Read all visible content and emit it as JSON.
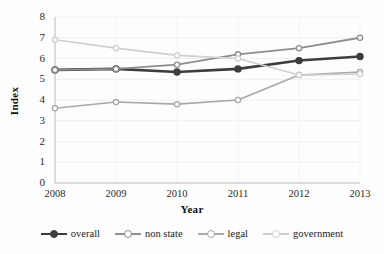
{
  "chart_data": {
    "type": "line",
    "title": "",
    "xlabel": "Year",
    "ylabel": "Index",
    "categories": [
      "2008",
      "2009",
      "2010",
      "2011",
      "2012",
      "2013"
    ],
    "x": [
      2008,
      2009,
      2010,
      2011,
      2012,
      2013
    ],
    "ylim": [
      0,
      8
    ],
    "yticks": [
      "0",
      "1",
      "2",
      "3",
      "4",
      "5",
      "6",
      "7",
      "8"
    ],
    "ytick_values": [
      0,
      1,
      2,
      3,
      4,
      5,
      6,
      7,
      8
    ],
    "grid": true,
    "legend_position": "bottom",
    "markers": "circle",
    "series": [
      {
        "name": "overall",
        "color": "#3d3d3d",
        "width": 2.6,
        "values": [
          5.45,
          5.5,
          5.35,
          5.5,
          5.9,
          6.1
        ]
      },
      {
        "name": "non state",
        "color": "#8e8e8e",
        "width": 1.8,
        "values": [
          5.45,
          5.5,
          5.7,
          6.2,
          6.5,
          7.0
        ]
      },
      {
        "name": "legal",
        "color": "#a8a8a8",
        "width": 1.6,
        "values": [
          3.6,
          3.9,
          3.8,
          4.0,
          5.2,
          5.35
        ]
      },
      {
        "name": "government",
        "color": "#cfcfcf",
        "width": 1.6,
        "values": [
          6.9,
          6.5,
          6.15,
          6.0,
          5.2,
          5.25
        ]
      }
    ]
  },
  "axes": {
    "y_label": "Index",
    "x_label": "Year"
  }
}
